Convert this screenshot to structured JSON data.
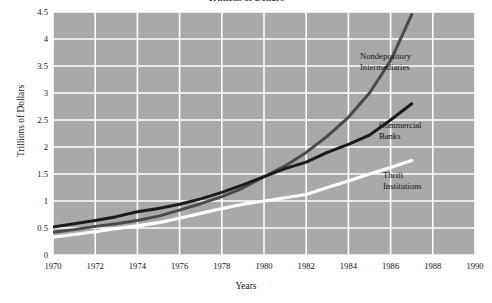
{
  "chart_data": {
    "type": "line",
    "title": "Trillions of Dollars",
    "xlabel": "Years",
    "ylabel": "Trillions of Dollars",
    "xlim": [
      1970,
      1990
    ],
    "ylim": [
      0,
      4.5
    ],
    "grid": true,
    "legend_position": "inline-annotations",
    "xticks": [
      "1970",
      "1972",
      "1974",
      "1976",
      "1978",
      "1980",
      "1982",
      "1984",
      "1986",
      "1988",
      "1990"
    ],
    "yticks": [
      "0",
      "0.5",
      "1",
      "1.5",
      "2",
      "2.5",
      "3",
      "3.5",
      "4",
      "4.5"
    ],
    "x": [
      1970,
      1971,
      1972,
      1973,
      1974,
      1975,
      1976,
      1977,
      1978,
      1979,
      1980,
      1981,
      1982,
      1983,
      1984,
      1985,
      1986,
      1987
    ],
    "series": [
      {
        "name": "Nondepository Intermediaries",
        "color": "#4a4a4a",
        "values": [
          0.42,
          0.47,
          0.53,
          0.58,
          0.64,
          0.72,
          0.83,
          0.95,
          1.08,
          1.24,
          1.45,
          1.65,
          1.9,
          2.2,
          2.55,
          3.0,
          3.6,
          4.45
        ]
      },
      {
        "name": "Commercial Banks",
        "color": "#1b1b1b",
        "values": [
          0.52,
          0.58,
          0.64,
          0.71,
          0.8,
          0.86,
          0.94,
          1.04,
          1.16,
          1.3,
          1.45,
          1.6,
          1.72,
          1.9,
          2.05,
          2.22,
          2.5,
          2.8
        ]
      },
      {
        "name": "Thrift Institutions",
        "color": "#ffffff",
        "values": [
          0.33,
          0.38,
          0.43,
          0.49,
          0.54,
          0.6,
          0.68,
          0.77,
          0.86,
          0.94,
          1.0,
          1.06,
          1.12,
          1.25,
          1.37,
          1.5,
          1.62,
          1.75
        ]
      }
    ],
    "annotations": [
      {
        "id": "nondepository",
        "line1": "Nondepository",
        "line2": "Intermediaries"
      },
      {
        "id": "commercial",
        "line1": "Commercial",
        "line2": "Banks"
      },
      {
        "id": "thrift",
        "line1": "Thrift",
        "line2": "Institutions"
      }
    ],
    "plot_background": "#a9a9a9",
    "gridline_color": "#ffffff",
    "page_background": "#ffffff"
  }
}
